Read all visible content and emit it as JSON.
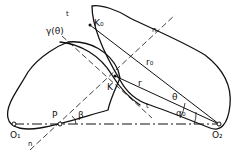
{
  "diagram": {
    "type": "gear-mesh-geometry",
    "labels": {
      "gamma_theta": "γ(θ)",
      "t_top": "t",
      "K0": "K₀",
      "n_top": "n",
      "r0": "r₀",
      "K": "K",
      "r": "r",
      "theta": "θ",
      "alpha0": "α₀",
      "t_bottom": "t",
      "P": "P",
      "beta": "β",
      "O1": "O₁",
      "O2": "O₂",
      "n_bottom": "n"
    },
    "colors": {
      "stroke": "#111111",
      "background": "#ffffff"
    }
  }
}
